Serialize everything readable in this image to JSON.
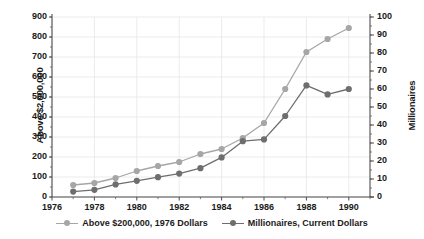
{
  "chart_data": {
    "type": "line",
    "title": "",
    "xlabel": "",
    "x": [
      1977,
      1978,
      1979,
      1980,
      1981,
      1982,
      1983,
      1984,
      1985,
      1986,
      1987,
      1988,
      1989,
      1990
    ],
    "xlim": [
      1976,
      1991
    ],
    "x_ticks": [
      "1976",
      "1978",
      "1980",
      "1982",
      "1984",
      "1986",
      "1988",
      "1990"
    ],
    "x_tick_values": [
      1976,
      1978,
      1980,
      1982,
      1984,
      1986,
      1988,
      1990
    ],
    "grid": true,
    "legend_position": "bottom",
    "series": [
      {
        "name": "Above $200,000, 1976 Dollars",
        "axis": "left",
        "color": "#a6a6a6",
        "marker": "circle",
        "values": [
          60,
          70,
          95,
          130,
          155,
          175,
          215,
          240,
          295,
          370,
          540,
          725,
          790,
          845
        ]
      },
      {
        "name": "Millionaires, Current Dollars",
        "axis": "right",
        "color": "#6e6e6e",
        "marker": "circle",
        "values": [
          3,
          4,
          7,
          9,
          11,
          13,
          16,
          22,
          31,
          32,
          45,
          62,
          57,
          60
        ]
      }
    ],
    "left_axis": {
      "label": "Above $2,000,000",
      "ylim": [
        0,
        900
      ],
      "ticks": [
        "0",
        "100",
        "200",
        "300",
        "400",
        "500",
        "600",
        "700",
        "800",
        "900"
      ],
      "tick_values": [
        0,
        100,
        200,
        300,
        400,
        500,
        600,
        700,
        800,
        900
      ]
    },
    "right_axis": {
      "label": "Millionaires",
      "ylim": [
        0,
        100
      ],
      "ticks": [
        "0",
        "10",
        "20",
        "30",
        "40",
        "50",
        "60",
        "70",
        "80",
        "90",
        "100"
      ],
      "tick_values": [
        0,
        10,
        20,
        30,
        40,
        50,
        60,
        70,
        80,
        90,
        100
      ]
    },
    "legend": [
      "Above $200,000, 1976 Dollars",
      "Millionaires, Current Dollars"
    ]
  },
  "colors": {
    "series_light": "#a6a6a6",
    "series_dark": "#6e6e6e",
    "axis": "#4d4d4d",
    "grid": "#e6e6e6",
    "text": "#1a1a1a",
    "background": "#ffffff"
  }
}
